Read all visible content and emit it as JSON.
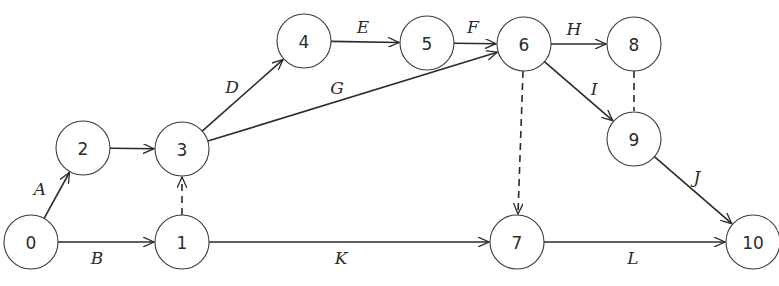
{
  "diagram": {
    "type": "activity-on-arrow network",
    "nodes": [
      {
        "id": "0",
        "label": "0",
        "x": 31,
        "y": 242
      },
      {
        "id": "1",
        "label": "1",
        "x": 182,
        "y": 242
      },
      {
        "id": "2",
        "label": "2",
        "x": 83,
        "y": 148
      },
      {
        "id": "3",
        "label": "3",
        "x": 182,
        "y": 149
      },
      {
        "id": "4",
        "label": "4",
        "x": 304,
        "y": 41
      },
      {
        "id": "5",
        "label": "5",
        "x": 427,
        "y": 43
      },
      {
        "id": "6",
        "label": "6",
        "x": 524,
        "y": 44
      },
      {
        "id": "7",
        "label": "7",
        "x": 517,
        "y": 242
      },
      {
        "id": "8",
        "label": "8",
        "x": 634,
        "y": 44
      },
      {
        "id": "9",
        "label": "9",
        "x": 634,
        "y": 139
      },
      {
        "id": "10",
        "label": "10",
        "x": 753,
        "y": 242
      }
    ],
    "node_radius": 27,
    "edges": [
      {
        "from": "0",
        "to": "2",
        "label": "A",
        "style": "solid",
        "arrow": true,
        "lx": 40,
        "ly": 189
      },
      {
        "from": "0",
        "to": "1",
        "label": "B",
        "style": "solid",
        "arrow": true,
        "lx": 97,
        "ly": 258
      },
      {
        "from": "2",
        "to": "3",
        "label": "",
        "style": "solid",
        "arrow": true
      },
      {
        "from": "1",
        "to": "3",
        "label": "",
        "style": "dashed",
        "arrow": true
      },
      {
        "from": "3",
        "to": "4",
        "label": "D",
        "style": "solid",
        "arrow": true,
        "lx": 232,
        "ly": 87
      },
      {
        "from": "4",
        "to": "5",
        "label": "E",
        "style": "solid",
        "arrow": true,
        "lx": 363,
        "ly": 27
      },
      {
        "from": "5",
        "to": "6",
        "label": "F",
        "style": "solid",
        "arrow": true,
        "lx": 473,
        "ly": 27
      },
      {
        "from": "3",
        "to": "6",
        "label": "G",
        "style": "solid",
        "arrow": true,
        "lx": 337,
        "ly": 88
      },
      {
        "from": "6",
        "to": "8",
        "label": "H",
        "style": "solid",
        "arrow": true,
        "lx": 574,
        "ly": 29
      },
      {
        "from": "6",
        "to": "9",
        "label": "I",
        "style": "solid",
        "arrow": true,
        "lx": 594,
        "ly": 89
      },
      {
        "from": "8",
        "to": "9",
        "label": "",
        "style": "dashed",
        "arrow": false
      },
      {
        "from": "6",
        "to": "7",
        "label": "",
        "style": "dashed",
        "arrow": true
      },
      {
        "from": "9",
        "to": "10",
        "label": "J",
        "style": "solid",
        "arrow": true,
        "lx": 697,
        "ly": 177
      },
      {
        "from": "1",
        "to": "7",
        "label": "K",
        "style": "solid",
        "arrow": true,
        "lx": 341,
        "ly": 258
      },
      {
        "from": "7",
        "to": "10",
        "label": "L",
        "style": "solid",
        "arrow": true,
        "lx": 633,
        "ly": 258
      }
    ]
  }
}
